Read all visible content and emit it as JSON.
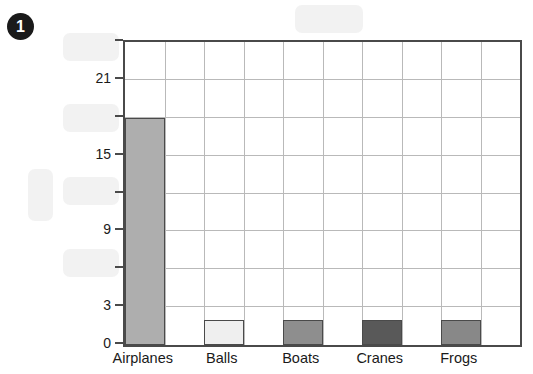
{
  "question": {
    "number": "1"
  },
  "chart_data": {
    "type": "bar",
    "title": "",
    "xlabel": "",
    "ylabel": "",
    "categories": [
      "Airplanes",
      "Balls",
      "Boats",
      "Cranes",
      "Frogs"
    ],
    "values": [
      18,
      2,
      2,
      2,
      2
    ],
    "bar_colors": [
      "#aeaeae",
      "#efefef",
      "#8e8e8e",
      "#595959",
      "#888888"
    ],
    "bar_border_color": "#4a4a4a",
    "ylim": [
      0,
      24
    ],
    "y_ticks": [
      0,
      3,
      6,
      9,
      12,
      15,
      18,
      21,
      24
    ],
    "y_tick_labels": [
      "0",
      "3",
      "",
      "9",
      "",
      "15",
      "",
      "21",
      ""
    ],
    "grid": true,
    "grid_color": "#b9b9b9",
    "x_columns": 10,
    "legend": "none"
  },
  "redactions": [
    {
      "name": "chart-title-redaction",
      "x": 295,
      "y": 5,
      "w": 68,
      "h": 28
    },
    {
      "name": "y-label-24-redaction",
      "x": 63,
      "y": 33,
      "w": 56,
      "h": 28
    },
    {
      "name": "y-label-18-redaction",
      "x": 63,
      "y": 104,
      "w": 56,
      "h": 28
    },
    {
      "name": "y-axis-title-redaction",
      "x": 28,
      "y": 169,
      "w": 25,
      "h": 52
    },
    {
      "name": "y-label-12-redaction",
      "x": 63,
      "y": 177,
      "w": 56,
      "h": 28
    },
    {
      "name": "y-label-6-redaction",
      "x": 63,
      "y": 249,
      "w": 56,
      "h": 28
    }
  ]
}
